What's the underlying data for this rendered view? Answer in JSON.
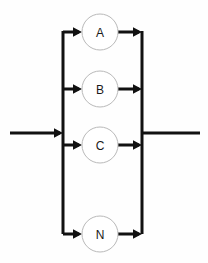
{
  "diagram": {
    "canvas": {
      "width": 208,
      "height": 263,
      "background": "#fefefe"
    },
    "colors": {
      "line": "#111111",
      "node_stroke": "#b9b9b9",
      "node_fill": "#ffffff",
      "label": "#1a1a1a"
    },
    "geometry": {
      "left_bus_x": 63,
      "right_bus_x": 142,
      "bus_top_y": 31,
      "bus_bottom_y": 234,
      "node_center_x": 100,
      "node_radius": 18,
      "input_start_x": 10,
      "input_y": 133,
      "output_end_x": 200,
      "output_y": 133
    },
    "nodes": [
      {
        "label": "A",
        "cx": 100,
        "cy": 32
      },
      {
        "label": "B",
        "cx": 100,
        "cy": 89
      },
      {
        "label": "C",
        "cx": 100,
        "cy": 145
      },
      {
        "label": "N",
        "cx": 100,
        "cy": 234
      }
    ],
    "input_edge": {
      "label": "",
      "from_x": 10,
      "to_x": 63,
      "y": 133
    },
    "output_edge": {
      "label": "",
      "from_x": 142,
      "to_x": 200,
      "y": 133
    }
  }
}
